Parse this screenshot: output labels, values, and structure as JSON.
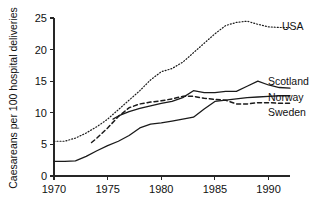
{
  "chart_data": {
    "type": "line",
    "title": "",
    "xlabel": "",
    "ylabel": "Caesareans per 100 hospital deliveries",
    "xlim": [
      1970,
      1992
    ],
    "ylim": [
      0,
      25
    ],
    "xticks": [
      1970,
      1975,
      1980,
      1985,
      1990
    ],
    "yticks": [
      0,
      5,
      10,
      15,
      20,
      25
    ],
    "xtick_labels": [
      "1970",
      "1975",
      "1980",
      "1985",
      "1990"
    ],
    "ytick_labels": [
      "0",
      "5",
      "10",
      "15",
      "20",
      "25"
    ],
    "grid": false,
    "legend_position": "right-inline-labels",
    "series": [
      {
        "name": "USA",
        "label": "USA",
        "style": "dotted",
        "color": "#1a1a1a",
        "x": [
          1970,
          1971,
          1972,
          1973,
          1974,
          1975,
          1976,
          1977,
          1978,
          1979,
          1980,
          1981,
          1982,
          1983,
          1984,
          1985,
          1986,
          1987,
          1988,
          1989,
          1990,
          1991,
          1992
        ],
        "values": [
          5.5,
          5.5,
          6.0,
          6.8,
          7.8,
          9.0,
          10.5,
          12.0,
          13.5,
          15.2,
          16.5,
          17.0,
          18.0,
          19.5,
          21.0,
          22.5,
          23.8,
          24.3,
          24.5,
          24.0,
          23.6,
          23.5,
          23.5
        ]
      },
      {
        "name": "Scotland",
        "label": "Scotland",
        "style": "solid",
        "color": "#1a1a1a",
        "x": [
          1975.5,
          1976,
          1977,
          1978,
          1979,
          1980,
          1981,
          1982,
          1983,
          1984,
          1985,
          1986,
          1987,
          1988,
          1989,
          1990,
          1991,
          1992
        ],
        "values": [
          9.0,
          9.5,
          10.2,
          10.7,
          11.1,
          11.5,
          11.8,
          12.4,
          13.5,
          13.2,
          13.2,
          13.4,
          13.4,
          14.2,
          15.0,
          14.4,
          14.0,
          13.9
        ]
      },
      {
        "name": "Norway",
        "label": "Norway",
        "style": "solid",
        "color": "#1a1a1a",
        "x": [
          1970,
          1971,
          1972,
          1973,
          1974,
          1975,
          1976,
          1977,
          1978,
          1979,
          1980,
          1981,
          1982,
          1983,
          1984,
          1985,
          1986,
          1987,
          1988,
          1989,
          1990,
          1991,
          1992
        ],
        "values": [
          2.3,
          2.3,
          2.4,
          3.1,
          4.0,
          4.8,
          5.5,
          6.4,
          7.6,
          8.2,
          8.4,
          8.7,
          9.0,
          9.3,
          10.6,
          11.8,
          12.0,
          12.2,
          12.4,
          12.5,
          12.6,
          12.7,
          12.7
        ]
      },
      {
        "name": "Sweden",
        "label": "Sweden",
        "style": "dashed",
        "color": "#1a1a1a",
        "x": [
          1973.5,
          1974,
          1975,
          1976,
          1977,
          1978,
          1979,
          1980,
          1981,
          1982,
          1983,
          1984,
          1985,
          1986,
          1987,
          1988,
          1989,
          1990,
          1991,
          1992
        ],
        "values": [
          5.3,
          6.0,
          7.6,
          9.4,
          10.8,
          11.4,
          11.7,
          11.9,
          12.2,
          12.6,
          12.6,
          12.3,
          12.1,
          12.0,
          11.4,
          11.4,
          11.6,
          11.6,
          11.5,
          11.5
        ]
      }
    ],
    "series_label_positions": [
      {
        "name": "USA",
        "x": 282,
        "y": 30
      },
      {
        "name": "Scotland",
        "x": 268,
        "y": 85
      },
      {
        "name": "Norway",
        "x": 268,
        "y": 101
      },
      {
        "name": "Sweden",
        "x": 268,
        "y": 116
      }
    ]
  }
}
